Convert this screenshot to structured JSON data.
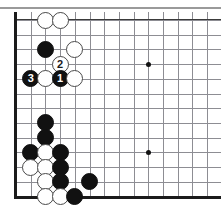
{
  "figure": {
    "kind": "go-board-diagram",
    "width": 221,
    "height": 224,
    "background_color": "#ffffff",
    "top_rule_color": "#9a9a9a"
  },
  "board": {
    "grid_color": "#8d8d93",
    "edge_color": "#1b1b1b",
    "cell_size": 14.7,
    "origin_x": 16,
    "origin_y": 8,
    "columns_visible": 14,
    "rows_visible": 13,
    "left_edge_visible": true,
    "bottom_edge_visible": true,
    "top_edge_visible": true,
    "right_edge_visible": false,
    "star_points": [
      {
        "name": "star-point-upper-right",
        "col": 9,
        "row": 3
      },
      {
        "name": "star-point-lower-right",
        "col": 9,
        "row": 9
      }
    ]
  },
  "stones": [
    {
      "name": "white-stone-c1",
      "color": "white",
      "col": 2,
      "row": 0,
      "label": ""
    },
    {
      "name": "white-stone-d1",
      "color": "white",
      "col": 3,
      "row": 0,
      "label": ""
    },
    {
      "name": "black-stone-c3",
      "color": "black",
      "col": 2,
      "row": 2,
      "label": ""
    },
    {
      "name": "white-stone-e3",
      "color": "white",
      "col": 4,
      "row": 2,
      "label": ""
    },
    {
      "name": "white-stone-move-2",
      "color": "white",
      "col": 3,
      "row": 3,
      "label": "2"
    },
    {
      "name": "black-stone-move-3",
      "color": "black",
      "col": 1,
      "row": 4,
      "label": "3"
    },
    {
      "name": "white-stone-c5",
      "color": "white",
      "col": 2,
      "row": 4,
      "label": ""
    },
    {
      "name": "black-stone-move-1",
      "color": "black",
      "col": 3,
      "row": 4,
      "label": "1"
    },
    {
      "name": "white-stone-e5",
      "color": "white",
      "col": 4,
      "row": 4,
      "label": ""
    },
    {
      "name": "black-stone-c8",
      "color": "black",
      "col": 2,
      "row": 7,
      "label": ""
    },
    {
      "name": "black-stone-c9",
      "color": "black",
      "col": 2,
      "row": 8,
      "label": ""
    },
    {
      "name": "black-stone-b10",
      "color": "black",
      "col": 1,
      "row": 9,
      "label": ""
    },
    {
      "name": "white-stone-c10",
      "color": "white",
      "col": 2,
      "row": 9,
      "label": ""
    },
    {
      "name": "black-stone-d10",
      "color": "black",
      "col": 3,
      "row": 9,
      "label": ""
    },
    {
      "name": "white-stone-b11",
      "color": "white",
      "col": 1,
      "row": 10,
      "label": ""
    },
    {
      "name": "white-stone-c11",
      "color": "white",
      "col": 2,
      "row": 10,
      "label": ""
    },
    {
      "name": "black-stone-d11",
      "color": "black",
      "col": 3,
      "row": 10,
      "label": ""
    },
    {
      "name": "white-stone-c12",
      "color": "white",
      "col": 2,
      "row": 11,
      "label": ""
    },
    {
      "name": "black-stone-d12",
      "color": "black",
      "col": 3,
      "row": 11,
      "label": ""
    },
    {
      "name": "black-stone-f12",
      "color": "black",
      "col": 5,
      "row": 11,
      "label": ""
    },
    {
      "name": "white-stone-c13",
      "color": "white",
      "col": 2,
      "row": 12,
      "label": ""
    },
    {
      "name": "white-stone-d13",
      "color": "white",
      "col": 3,
      "row": 12,
      "label": ""
    },
    {
      "name": "black-stone-e13",
      "color": "black",
      "col": 4,
      "row": 12,
      "label": ""
    }
  ]
}
